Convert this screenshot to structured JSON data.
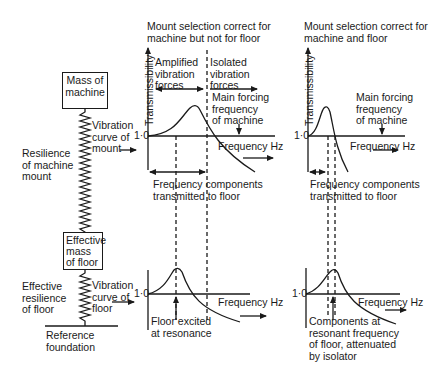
{
  "left_model": {
    "mass_machine_box": "Mass of\nmachine",
    "resilience_machine_label": "Resilience\nof machine\nmount",
    "vibration_curve_mount_label": "Vibration\ncurve of\nmount",
    "effective_mass_floor_box": "Effective\nmass\nof floor",
    "effective_resilience_floor_label": "Effective\nresilience\nof floor",
    "vibration_curve_floor_label": "Vibration\ncurve of\nfloor",
    "reference_foundation_label": "Reference\nfoundation"
  },
  "middle_column": {
    "title": "Mount selection correct for\nmachine but not for floor",
    "top_graph": {
      "ylabel": "Transmissibility",
      "y_tick": "1·0",
      "xlabel": "Frequency Hz",
      "amplified_label": "Amplified\nvibration\nforces",
      "isolated_label": "Isolated\nvibration\nforces",
      "forcing_label": "Main forcing\nfrequency\nof machine",
      "transmitted_label": "Frequency components\ntransmitted to floor"
    },
    "bottom_graph": {
      "y_tick": "1·0",
      "xlabel": "Frequency Hz",
      "annotation": "Floor excited\nat resonance"
    }
  },
  "right_column": {
    "title": "Mount selection correct for\nmachine and floor",
    "top_graph": {
      "ylabel": "Transmissibility",
      "y_tick": "1·0",
      "xlabel": "Frequency Hz",
      "forcing_label": "Main forcing\nfrequency\nof machine",
      "transmitted_label": "Frequency components\ntransmitted to floor"
    },
    "bottom_graph": {
      "y_tick": "1·0",
      "xlabel": "Frequency Hz",
      "annotation": "Components at\nresonant frequency\nof floor, attenuated\nby isolator"
    }
  },
  "colors": {
    "ink": "#1a1a1a",
    "background": "#ffffff"
  }
}
